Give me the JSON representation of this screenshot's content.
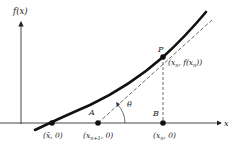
{
  "diagram": {
    "axes": {
      "y_label": "f(x)",
      "x_label": "x"
    },
    "points": [
      {
        "id": "root",
        "label": "(x̄, 0)",
        "marker": true
      },
      {
        "id": "A",
        "name": "A",
        "label": "(x",
        "sub": "n+1",
        "label_end": ", 0)",
        "marker": true
      },
      {
        "id": "B",
        "name": "B",
        "label": "(x",
        "sub": "n",
        "label_end": ", 0)",
        "marker": true
      },
      {
        "id": "P",
        "name": "P",
        "label": "(x",
        "sub": "n",
        "label_mid": ", f(x",
        "sub2": "n",
        "label_end": "))",
        "marker": true
      }
    ],
    "angle_label": "θ",
    "elements": [
      "curve f(x)",
      "tangent line at P (dashed)",
      "vertical segment PB (dashed)"
    ],
    "colors": {
      "ink": "#222222",
      "background": "#ffffff"
    }
  }
}
